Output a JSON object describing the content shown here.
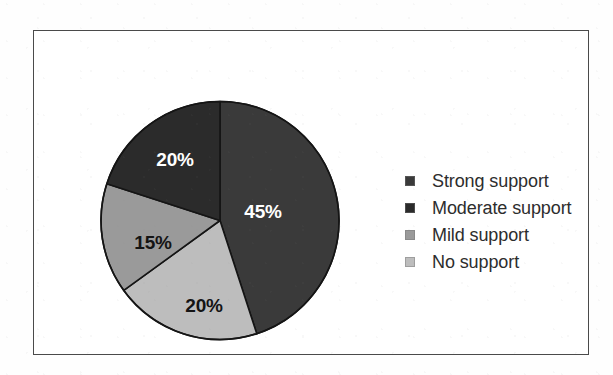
{
  "figure": {
    "background_color": "#ffffff",
    "frame_color": "#4a4a4a"
  },
  "chart_data": {
    "type": "pie",
    "title": "",
    "subtitle": "",
    "xlabel": "",
    "ylabel": "",
    "grid": false,
    "legend_position": "right",
    "start_angle_deg": 0,
    "direction": "clockwise",
    "categories": [
      "Strong support",
      "Moderate support",
      "Mild support",
      "No support"
    ],
    "values": [
      45,
      20,
      15,
      20
    ],
    "value_labels": [
      "45%",
      "20%",
      "15%",
      "20%"
    ],
    "colors": [
      "#3a3a3a",
      "#2b2b2b",
      "#9a9a9a",
      "#bdbdbd"
    ],
    "label_text_colors": [
      "#ffffff",
      "#ffffff",
      "#141414",
      "#141414"
    ],
    "slices": [
      {
        "name": "Strong support",
        "value": 45,
        "label": "45%",
        "color": "#3a3a3a",
        "label_color": "#ffffff",
        "start_deg": 0,
        "end_deg": 162,
        "label_x": 163,
        "label_y": 113
      },
      {
        "name": "No support",
        "value": 20,
        "label": "20%",
        "color": "#bdbdbd",
        "label_color": "#141414",
        "start_deg": 162,
        "end_deg": 234,
        "label_x": 104,
        "label_y": 207
      },
      {
        "name": "Mild support",
        "value": 15,
        "label": "15%",
        "color": "#9a9a9a",
        "label_color": "#141414",
        "start_deg": 234,
        "end_deg": 288,
        "label_x": 53,
        "label_y": 144
      },
      {
        "name": "Moderate support",
        "value": 20,
        "label": "20%",
        "color": "#2b2b2b",
        "label_color": "#ffffff",
        "start_deg": 288,
        "end_deg": 360,
        "label_x": 75,
        "label_y": 61
      }
    ]
  },
  "legend": {
    "items": [
      {
        "label": "Strong support",
        "color": "#3a3a3a"
      },
      {
        "label": "Moderate support",
        "color": "#2b2b2b"
      },
      {
        "label": "Mild support",
        "color": "#9a9a9a"
      },
      {
        "label": "No support",
        "color": "#bdbdbd"
      }
    ]
  }
}
